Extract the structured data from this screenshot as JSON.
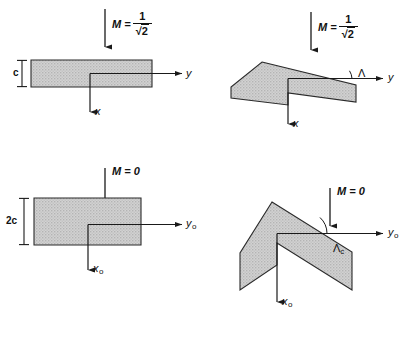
{
  "figure": {
    "background_color": "#ffffff",
    "fill_color": "#c9c9c9",
    "stroke_color": "#1a1a1a",
    "panels": [
      {
        "id": "top-left",
        "planform": "rectangular-wing",
        "mach_label": "M =",
        "mach_value_numerator": "1",
        "mach_value_denominator": "2",
        "mach_radical": "√",
        "dimension_label": "c",
        "axis_horizontal": "y",
        "axis_horizontal_sub": "",
        "axis_vertical": "x",
        "axis_vertical_sub": "",
        "angle_label": "",
        "angle_sub": ""
      },
      {
        "id": "top-right",
        "planform": "swept-wing",
        "mach_label": "M =",
        "mach_value_numerator": "1",
        "mach_value_denominator": "2",
        "mach_radical": "√",
        "dimension_label": "",
        "axis_horizontal": "y",
        "axis_horizontal_sub": "",
        "axis_vertical": "x",
        "axis_vertical_sub": "",
        "angle_label": "Λ",
        "angle_sub": ""
      },
      {
        "id": "bottom-left",
        "planform": "rectangular-wing",
        "mach_label": "M = 0",
        "mach_value_numerator": "",
        "mach_value_denominator": "",
        "mach_radical": "",
        "dimension_label": "2c",
        "axis_horizontal": "y",
        "axis_horizontal_sub": "o",
        "axis_vertical": "x",
        "axis_vertical_sub": "o",
        "angle_label": "",
        "angle_sub": ""
      },
      {
        "id": "bottom-right",
        "planform": "swept-wing",
        "mach_label": "M = 0",
        "mach_value_numerator": "",
        "mach_value_denominator": "",
        "mach_radical": "",
        "dimension_label": "",
        "axis_horizontal": "y",
        "axis_horizontal_sub": "o",
        "axis_vertical": "x",
        "axis_vertical_sub": "o",
        "angle_label": "Λ",
        "angle_sub": "c"
      }
    ]
  }
}
